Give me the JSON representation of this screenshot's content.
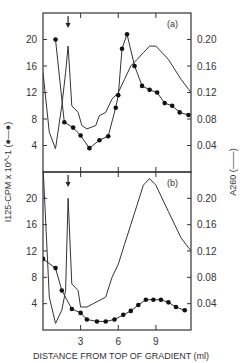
{
  "figure": {
    "xlabel": "DISTANCE FROM TOP OF GRADIENT (ml)",
    "ylabel_left": "I125-CPM x 10^-1 (●—●)",
    "ylabel_right": "A260 (——)",
    "panel_a_label": "(a)",
    "panel_b_label": "(b)",
    "x_ticks": [
      "3",
      "6",
      "9"
    ],
    "left_ticks_a": [
      "20",
      "16",
      "12",
      "8",
      "4"
    ],
    "left_ticks_b": [
      "20",
      "16",
      "12",
      "8",
      "4"
    ],
    "right_ticks_a": [
      "0.20",
      "0.16",
      "0.12",
      "0.08",
      "0.04"
    ],
    "right_ticks_b": [
      "0.20",
      "0.16",
      "0.12",
      "0.08",
      "0.04"
    ],
    "arrow_marker": "↓"
  },
  "chart_data": [
    {
      "type": "line",
      "title": "(a)",
      "xlabel": "DISTANCE FROM TOP OF GRADIENT (ml)",
      "ylabel": "I125-CPM x 10^-1",
      "y2label": "A260",
      "xlim": [
        0,
        11.8
      ],
      "ylim": [
        0,
        24
      ],
      "y2lim": [
        0,
        0.24
      ],
      "arrow_x": 2.0,
      "series": [
        {
          "name": "I125-CPM x 10^-1 (dots)",
          "axis": "left",
          "x": [
            1.0,
            1.7,
            2.4,
            3.0,
            3.7,
            4.5,
            5.2,
            5.8,
            6.0,
            6.3,
            6.7,
            7.3,
            7.9,
            8.5,
            9.1,
            9.7,
            10.3,
            10.9,
            11.6
          ],
          "y": [
            20,
            7.5,
            6.7,
            5.5,
            3.6,
            4.8,
            5.4,
            9.7,
            11.6,
            18.6,
            20.8,
            16.0,
            13.0,
            12.4,
            12.0,
            10.4,
            10.0,
            9.0,
            8.6
          ]
        },
        {
          "name": "A260 (solid line)",
          "axis": "right",
          "x": [
            0.0,
            0.5,
            1.0,
            1.5,
            1.8,
            2.0,
            2.3,
            2.8,
            3.1,
            3.5,
            4.2,
            4.5,
            5.0,
            5.5,
            6.0,
            6.5,
            7.0,
            7.5,
            8.0,
            8.5,
            9.0,
            10.0,
            11.0,
            11.8
          ],
          "y": [
            0.15,
            0.06,
            0.035,
            0.1,
            0.15,
            0.19,
            0.1,
            0.09,
            0.07,
            0.065,
            0.07,
            0.085,
            0.09,
            0.11,
            0.12,
            0.14,
            0.16,
            0.17,
            0.18,
            0.19,
            0.19,
            0.17,
            0.14,
            0.12
          ]
        }
      ]
    },
    {
      "type": "line",
      "title": "(b)",
      "xlabel": "DISTANCE FROM TOP OF GRADIENT (ml)",
      "ylabel": "I125-CPM x 10^-1",
      "y2label": "A260",
      "xlim": [
        0,
        11.8
      ],
      "ylim": [
        0,
        24
      ],
      "y2lim": [
        0,
        0.24
      ],
      "arrow_x": 2.0,
      "series": [
        {
          "name": "I125-CPM x 10^-1 (dots)",
          "axis": "left",
          "x": [
            0.0,
            1.0,
            1.5,
            2.3,
            3.0,
            3.5,
            4.3,
            5.0,
            5.7,
            6.4,
            7.0,
            7.6,
            8.2,
            8.8,
            9.4,
            10.0,
            10.6,
            11.3
          ],
          "y": [
            10.8,
            9.4,
            6.0,
            3.2,
            2.6,
            1.6,
            1.3,
            1.3,
            1.6,
            2.3,
            2.9,
            3.8,
            4.6,
            4.6,
            4.6,
            4.2,
            3.5,
            3.0
          ]
        },
        {
          "name": "A260 (solid line)",
          "axis": "right",
          "x": [
            0.0,
            0.5,
            1.0,
            1.5,
            1.8,
            2.0,
            2.3,
            2.8,
            3.0,
            3.5,
            4.0,
            5.0,
            5.5,
            6.0,
            6.5,
            7.0,
            7.5,
            8.0,
            8.5,
            9.0,
            10.0,
            11.0,
            11.8
          ],
          "y": [
            0.25,
            0.05,
            0.01,
            0.03,
            0.06,
            0.2,
            0.07,
            0.06,
            0.035,
            0.035,
            0.04,
            0.05,
            0.08,
            0.1,
            0.13,
            0.16,
            0.19,
            0.22,
            0.23,
            0.22,
            0.18,
            0.14,
            0.12
          ]
        }
      ]
    }
  ]
}
